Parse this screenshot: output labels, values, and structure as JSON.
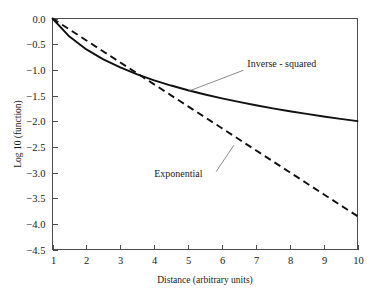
{
  "chart_data": {
    "type": "line",
    "title": "",
    "xlabel": "Distance (arbitrary units)",
    "ylabel": "Log 10 (function)",
    "xlim": [
      1,
      10
    ],
    "ylim": [
      -4.5,
      0.0
    ],
    "grid": false,
    "legend_position": "inline-annotations",
    "xticks": [
      "1",
      "2",
      "3",
      "4",
      "5",
      "6",
      "7",
      "8",
      "9",
      "10"
    ],
    "xtick_values": [
      1,
      2,
      3,
      4,
      5,
      6,
      7,
      8,
      9,
      10
    ],
    "yticks": [
      "0.0",
      "-0.5",
      "-1.0",
      "-1.5",
      "-2.0",
      "-2.5",
      "-3.0",
      "-3.5",
      "-4.0",
      "-4.5"
    ],
    "ytick_values": [
      0.0,
      -0.5,
      -1.0,
      -1.5,
      -2.0,
      -2.5,
      -3.0,
      -3.5,
      -4.0,
      -4.5
    ],
    "x": [
      1,
      1.5,
      2,
      2.5,
      3,
      3.5,
      4,
      4.5,
      5,
      5.5,
      6,
      6.5,
      7,
      7.5,
      8,
      8.5,
      9,
      9.5,
      10
    ],
    "series": [
      {
        "name": "Inverse - squared",
        "style": "solid",
        "color": "#111111",
        "values": [
          0.0,
          -0.352,
          -0.602,
          -0.796,
          -0.954,
          -1.088,
          -1.204,
          -1.306,
          -1.398,
          -1.48,
          -1.556,
          -1.625,
          -1.69,
          -1.75,
          -1.806,
          -1.859,
          -1.908,
          -1.955,
          -2.0
        ]
      },
      {
        "name": "Exponential",
        "style": "dashed",
        "color": "#111111",
        "values": [
          0.0,
          -0.214,
          -0.428,
          -0.642,
          -0.856,
          -1.07,
          -1.283,
          -1.497,
          -1.711,
          -1.925,
          -2.139,
          -2.353,
          -2.567,
          -2.781,
          -2.995,
          -3.209,
          -3.423,
          -3.637,
          -3.85
        ]
      }
    ],
    "annotations": [
      {
        "text": "Inverse - squared",
        "label_x": 6.75,
        "label_y": -0.95,
        "target_x": 5.0,
        "target_y": -1.42
      },
      {
        "text": "Exponential",
        "label_x": 4.0,
        "label_y": -3.08,
        "target_x": 6.35,
        "target_y": -2.47
      }
    ]
  },
  "axes": {
    "x_title": "Distance (arbitrary units)",
    "y_title": "Log 10 (function)"
  }
}
